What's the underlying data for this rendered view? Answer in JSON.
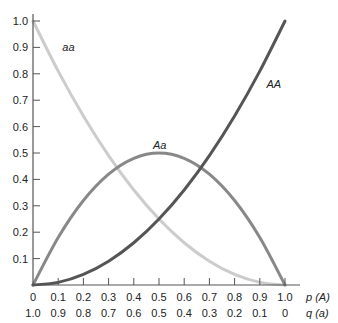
{
  "chart_data": {
    "type": "line",
    "title": "",
    "xlabel": "p (A)",
    "xlabel2": "q (a)",
    "ylabel": "",
    "xlim": [
      0,
      1.0
    ],
    "ylim": [
      0,
      1.0
    ],
    "grid": false,
    "x_ticks": [
      "0",
      "0.1",
      "0.2",
      "0.3",
      "0.4",
      "0.5",
      "0.6",
      "0.7",
      "0.8",
      "0.9",
      "1.0"
    ],
    "x_ticks_secondary": [
      "1.0",
      "0.9",
      "0.8",
      "0.7",
      "0.6",
      "0.5",
      "0.4",
      "0.3",
      "0.2",
      "0.1",
      "0"
    ],
    "y_ticks": [
      "0.1",
      "0.2",
      "0.3",
      "0.4",
      "0.5",
      "0.6",
      "0.7",
      "0.8",
      "0.9",
      "1.0"
    ],
    "x": [
      0,
      0.1,
      0.2,
      0.3,
      0.4,
      0.5,
      0.6,
      0.7,
      0.8,
      0.9,
      1.0
    ],
    "series": [
      {
        "name": "AA",
        "label": "AA",
        "color": "#555555",
        "values": [
          0,
          0.01,
          0.04,
          0.09,
          0.16,
          0.25,
          0.36,
          0.49,
          0.64,
          0.81,
          1.0
        ]
      },
      {
        "name": "Aa",
        "label": "Aa",
        "color": "#888888",
        "values": [
          0,
          0.18,
          0.32,
          0.42,
          0.48,
          0.5,
          0.48,
          0.42,
          0.32,
          0.18,
          0
        ]
      },
      {
        "name": "aa",
        "label": "aa",
        "color": "#cccccc",
        "values": [
          1.0,
          0.81,
          0.64,
          0.49,
          0.36,
          0.25,
          0.16,
          0.09,
          0.04,
          0.01,
          0
        ]
      }
    ],
    "annotations": [
      {
        "text": "aa",
        "x": 0.14,
        "y": 0.9
      },
      {
        "text": "Aa",
        "x": 0.5,
        "y": 0.53
      },
      {
        "text": "AA",
        "x": 0.95,
        "y": 0.76
      }
    ]
  }
}
